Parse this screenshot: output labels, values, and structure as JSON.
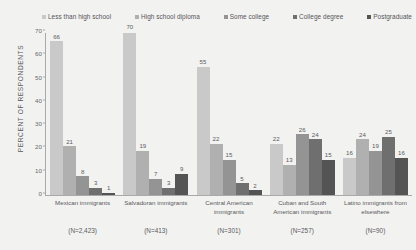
{
  "chart_data": {
    "type": "bar",
    "title": "",
    "xlabel": "",
    "ylabel": "PERCENT OF RESPONDENTS",
    "ylim": [
      0,
      70
    ],
    "yticks": [
      0,
      10,
      20,
      30,
      40,
      50,
      60,
      70
    ],
    "grid": false,
    "legend_position": "top",
    "categories": [
      "Mexican immigrants",
      "Salvadoran immigrants",
      "Central American immigrants",
      "Cuban and South American immigrants",
      "Latino immigrants from elsewhere"
    ],
    "category_notes": [
      "(N=2,423)",
      "(N=413)",
      "(N=301)",
      "(N=257)",
      "(N=90)"
    ],
    "series": [
      {
        "name": "Less than high school",
        "color": "#c9c9c9",
        "values": [
          66,
          70,
          55,
          22,
          16
        ]
      },
      {
        "name": "High school diploma",
        "color": "#b0b0b0",
        "values": [
          21,
          19,
          22,
          13,
          24
        ]
      },
      {
        "name": "Some college",
        "color": "#949494",
        "values": [
          8,
          7,
          15,
          26,
          19
        ]
      },
      {
        "name": "College degree",
        "color": "#6f6f6f",
        "values": [
          3,
          3,
          5,
          24,
          25
        ]
      },
      {
        "name": "Postgraduate",
        "color": "#545454",
        "values": [
          1,
          9,
          2,
          15,
          16
        ]
      }
    ]
  },
  "colors": {
    "background": "#f2f2f0",
    "axis": "#a9a9ab",
    "text": "#5a595e"
  }
}
